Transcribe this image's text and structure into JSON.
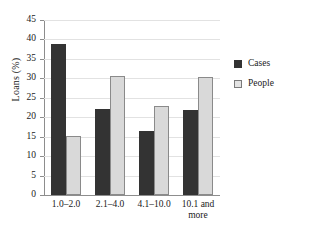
{
  "chart_data": {
    "type": "bar",
    "title": "",
    "xlabel": "",
    "ylabel": "Loans (%)",
    "ylim": [
      0,
      45
    ],
    "ytick_step": 5,
    "yticks": [
      "0",
      "5",
      "10",
      "15",
      "20",
      "25",
      "30",
      "35",
      "40",
      "45"
    ],
    "grid": true,
    "legend_position": "right",
    "categories": [
      "1.0–2.0",
      "2.1–4.0",
      "4.1–10.0",
      "10.1 and more"
    ],
    "category_lines": [
      [
        "1.0–2.0"
      ],
      [
        "2.1–4.0"
      ],
      [
        "4.1–10.0"
      ],
      [
        "10.1 and",
        "more"
      ]
    ],
    "series": [
      {
        "name": "Cases",
        "color": "#333333",
        "values": [
          38.8,
          22.1,
          16.5,
          21.9
        ]
      },
      {
        "name": "People",
        "color": "#d9d9d9",
        "values": [
          15.3,
          30.6,
          22.8,
          30.4
        ]
      }
    ]
  },
  "legend": {
    "items": [
      {
        "label": "Cases",
        "swatch": "cases"
      },
      {
        "label": "People",
        "swatch": "people"
      }
    ]
  },
  "axis": {
    "y_title": "Loans (%)"
  }
}
